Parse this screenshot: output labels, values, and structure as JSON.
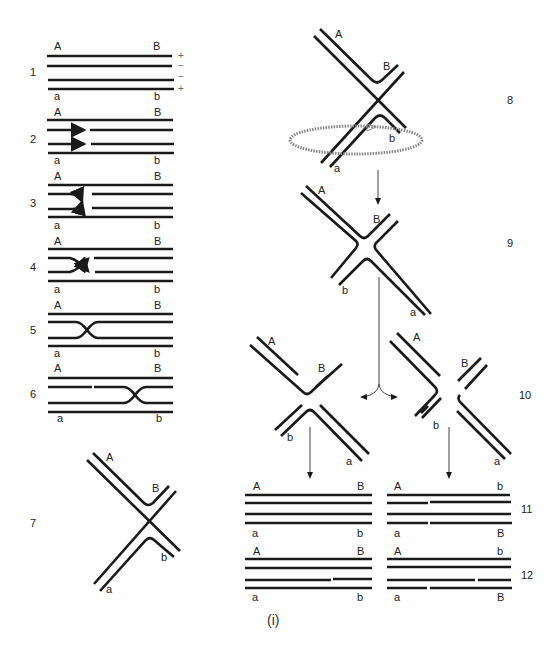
{
  "figure": {
    "caption": "(i)",
    "steps": {
      "s1": "1",
      "s2": "2",
      "s3": "3",
      "s4": "4",
      "s5": "5",
      "s6": "6",
      "s7": "7",
      "s8": "8",
      "s9": "9",
      "s10": "10",
      "s11": "11",
      "s12": "12"
    },
    "polarity": {
      "top1": "+",
      "top2": "−",
      "bot1": "−",
      "bot2": "+"
    },
    "labels": {
      "A": "A",
      "B": "B",
      "a": "a",
      "b": "b"
    },
    "stroke_color": "#1a1a1a",
    "background": "#ffffff"
  }
}
